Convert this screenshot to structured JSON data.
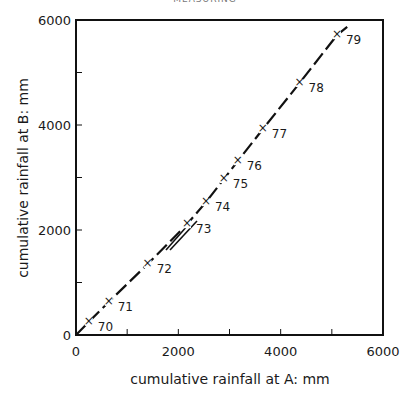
{
  "page_header": "MEASURING",
  "chart_data": {
    "type": "line",
    "title": "",
    "xlabel": "cumulative rainfall at A: mm",
    "ylabel": "cumulative rainfall at B: mm",
    "xlim": [
      0,
      6000
    ],
    "ylim": [
      0,
      6000
    ],
    "x_ticks": [
      0,
      2000,
      4000,
      6000
    ],
    "y_ticks": [
      0,
      2000,
      4000,
      6000
    ],
    "x_minor_ticks": [
      1000,
      3000,
      5000
    ],
    "y_minor_ticks": [
      1000,
      3000,
      5000
    ],
    "grid": false,
    "legend": null,
    "series": [
      {
        "name": "double mass curve",
        "marker": "x",
        "points": [
          {
            "label": "70",
            "x": 250,
            "y": 250
          },
          {
            "label": "71",
            "x": 640,
            "y": 630
          },
          {
            "label": "72",
            "x": 1400,
            "y": 1350
          },
          {
            "label": "73",
            "x": 2170,
            "y": 2110
          },
          {
            "label": "74",
            "x": 2540,
            "y": 2530
          },
          {
            "label": "75",
            "x": 2890,
            "y": 2970
          },
          {
            "label": "76",
            "x": 3160,
            "y": 3310
          },
          {
            "label": "77",
            "x": 3650,
            "y": 3920
          },
          {
            "label": "78",
            "x": 4370,
            "y": 4800
          },
          {
            "label": "79",
            "x": 5100,
            "y": 5710
          }
        ]
      }
    ],
    "annotations": [
      "Year labels 70–79 beside each point",
      "Arrow near point 73 indicating break in slope"
    ]
  }
}
